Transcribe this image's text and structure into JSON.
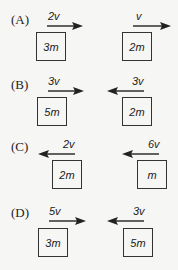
{
  "question": {
    "options": [
      {
        "label": "(A)",
        "left": {
          "mass": "3m",
          "velocity": "2v",
          "direction": "right"
        },
        "right": {
          "mass": "2m",
          "velocity": "v",
          "direction": "right"
        }
      },
      {
        "label": "(B)",
        "left": {
          "mass": "5m",
          "velocity": "3v",
          "direction": "right"
        },
        "right": {
          "mass": "2m",
          "velocity": "3v",
          "direction": "left"
        }
      },
      {
        "label": "(C)",
        "left": {
          "mass": "2m",
          "velocity": "2v",
          "direction": "left"
        },
        "right": {
          "mass": "m",
          "velocity": "6v",
          "direction": "left"
        }
      },
      {
        "label": "(D)",
        "left": {
          "mass": "3m",
          "velocity": "5v",
          "direction": "right"
        },
        "right": {
          "mass": "5m",
          "velocity": "3v",
          "direction": "left"
        }
      }
    ]
  },
  "colors": {
    "ink": "#222222",
    "background": "#f6f6f4"
  }
}
